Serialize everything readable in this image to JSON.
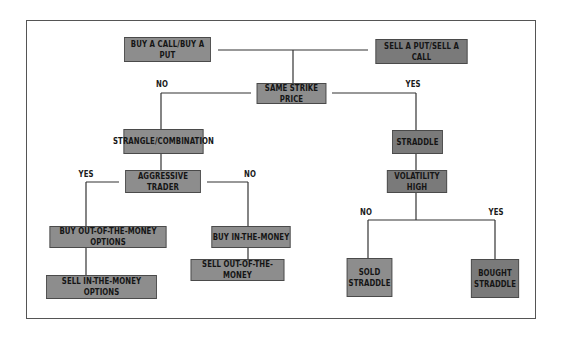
{
  "diagram": {
    "type": "decision-tree",
    "nodes": {
      "buy_call_put": "BUY A CALL/BUY A PUT",
      "sell_put_call": "SELL A PUT/SELL A CALL",
      "same_strike": "SAME STRIKE PRICE",
      "strangle": "STRANGLE/COMBINATION",
      "straddle": "STRADDLE",
      "aggressive": "AGGRESSIVE TRADER",
      "volatility": "VOLATILITY HIGH",
      "buy_otm": "BUY OUT-OF-THE-MONEY OPTIONS",
      "sell_itm": "SELL IN-THE-MONEY OPTIONS",
      "buy_itm": "BUY IN-THE-MONEY",
      "sell_otm": "SELL OUT-OF-THE-MONEY",
      "sold_straddle": "SOLD STRADDLE",
      "bought_straddle": "BOUGHT STRADDLE"
    },
    "edge_labels": {
      "strike_no": "NO",
      "strike_yes": "YES",
      "aggressive_yes": "YES",
      "aggressive_no": "NO",
      "volatility_no": "NO",
      "volatility_yes": "YES"
    },
    "colors": {
      "node_fill": "#8d8d8d",
      "node_fill_dark": "#7a7a7a",
      "node_border": "#4a4a4a",
      "line": "#333333",
      "frame": "#555555"
    }
  }
}
